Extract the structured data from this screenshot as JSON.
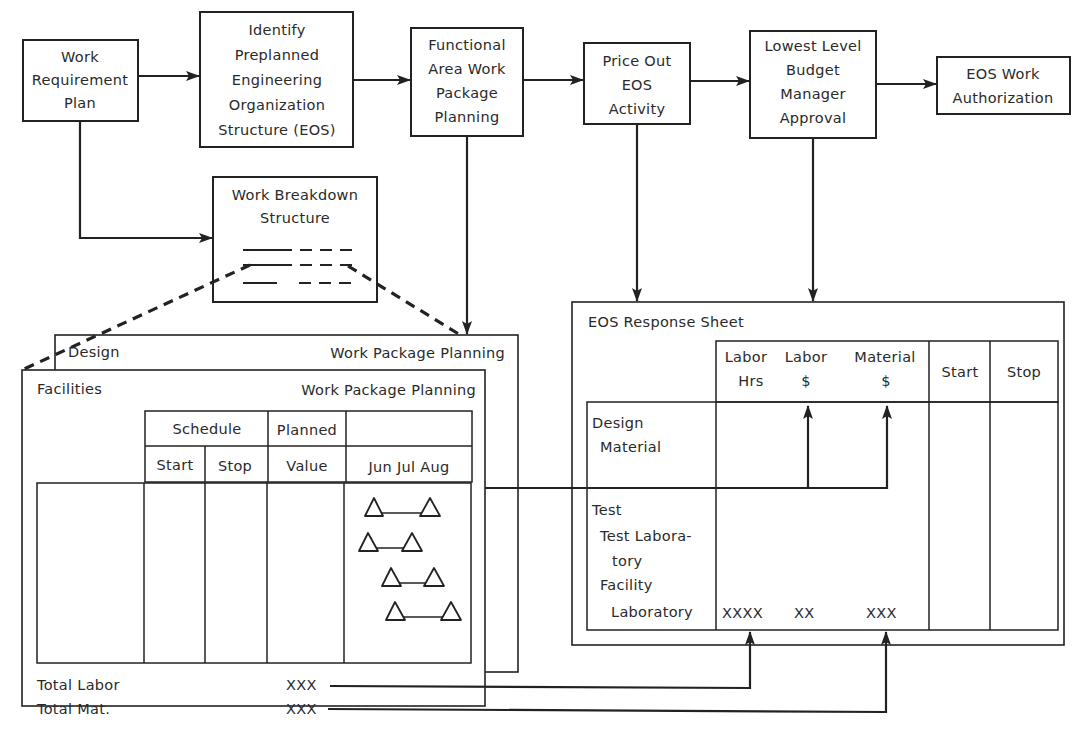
{
  "flow": {
    "work_requirement_plan": [
      "Work",
      "Requirement",
      "Plan"
    ],
    "identify_eos": [
      "Identify",
      "Preplanned",
      "Engineering",
      "Organization",
      "Structure (EOS)"
    ],
    "functional_area": [
      "Functional",
      "Area Work",
      "Package",
      "Planning"
    ],
    "price_out": [
      "Price Out",
      "EOS",
      "Activity"
    ],
    "budget_manager": [
      "Lowest Level",
      "Budget",
      "Manager",
      "Approval"
    ],
    "eos_authorization": [
      "EOS Work",
      "Authorization"
    ]
  },
  "wbs": {
    "title": [
      "Work Breakdown",
      "Structure"
    ]
  },
  "design_sheet": {
    "left_label": "Design",
    "right_label": "Work Package Planning"
  },
  "facilities_sheet": {
    "left_label": "Facilities",
    "right_label": "Work Package Planning",
    "headers": {
      "schedule": "Schedule",
      "planned": "Planned",
      "start": "Start",
      "stop": "Stop",
      "value": "Value",
      "months": "Jun Jul Aug"
    },
    "totals": [
      {
        "label": "Total Labor",
        "value": "XXX"
      },
      {
        "label": "Total Mat.",
        "value": "XXX"
      }
    ],
    "milestones_count": 4
  },
  "eos_response_sheet": {
    "title": "EOS Response  Sheet",
    "headers": {
      "labor_hrs": [
        "Labor",
        "Hrs"
      ],
      "labor_dollars": [
        "Labor",
        "$"
      ],
      "material_dollars": [
        "Material",
        "$"
      ],
      "start": "Start",
      "stop": "Stop"
    },
    "rows": {
      "design": [
        "Design",
        "Material"
      ],
      "test": [
        "Test",
        "Test Labora-",
        "tory",
        "Facility",
        "Laboratory"
      ]
    },
    "values": {
      "labor_hrs": "XXXX",
      "labor_dollars": "XX",
      "material_dollars": "XXX"
    }
  }
}
